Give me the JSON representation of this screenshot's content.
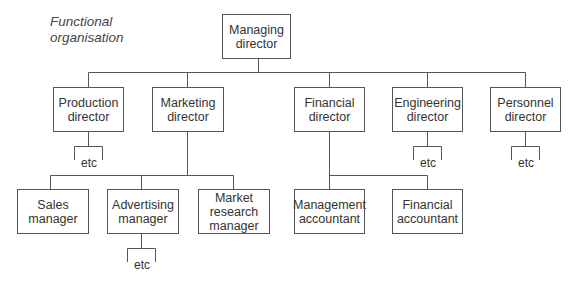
{
  "title": "Functional\norganisation",
  "root": {
    "label": "Managing\ndirector"
  },
  "directors": [
    {
      "label": "Production\ndirector"
    },
    {
      "label": "Marketing\ndirector"
    },
    {
      "label": "Financial\ndirector"
    },
    {
      "label": "Engineering\ndirector"
    },
    {
      "label": "Personnel\ndirector"
    }
  ],
  "managers": [
    {
      "label": "Sales\nmanager",
      "parent": "Marketing director"
    },
    {
      "label": "Advertising\nmanager",
      "parent": "Marketing director"
    },
    {
      "label": "Market\nresearch\nmanager",
      "parent": "Marketing director"
    },
    {
      "label": "Management\naccountant",
      "parent": "Financial director"
    },
    {
      "label": "Financial\naccountant",
      "parent": "Financial director"
    }
  ],
  "etc_labels": {
    "production": "etc",
    "engineering": "etc",
    "personnel": "etc",
    "advertising": "etc"
  }
}
